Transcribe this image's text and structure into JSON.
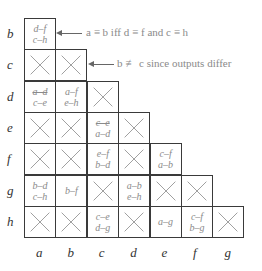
{
  "row_labels": [
    "b",
    "c",
    "d",
    "e",
    "f",
    "g",
    "h"
  ],
  "col_labels": [
    "a",
    "b",
    "c",
    "d",
    "e",
    "f",
    "g"
  ],
  "cells": [
    {
      "row": "b",
      "col": "a",
      "type": "pairs",
      "pairs": [
        "d–f",
        "c–h"
      ]
    },
    {
      "row": "c",
      "col": "a",
      "type": "x"
    },
    {
      "row": "c",
      "col": "b",
      "type": "x"
    },
    {
      "row": "d",
      "col": "a",
      "type": "pairs",
      "pairs": [
        "a–d",
        "c–e"
      ],
      "struck": [
        true,
        false
      ]
    },
    {
      "row": "d",
      "col": "b",
      "type": "pairs",
      "pairs": [
        "a–f",
        "e–h"
      ]
    },
    {
      "row": "d",
      "col": "c",
      "type": "x"
    },
    {
      "row": "e",
      "col": "a",
      "type": "x"
    },
    {
      "row": "e",
      "col": "b",
      "type": "x"
    },
    {
      "row": "e",
      "col": "c",
      "type": "pairs",
      "pairs": [
        "c–e",
        "a–d"
      ],
      "struck": [
        true,
        false
      ]
    },
    {
      "row": "e",
      "col": "d",
      "type": "x"
    },
    {
      "row": "f",
      "col": "a",
      "type": "x"
    },
    {
      "row": "f",
      "col": "b",
      "type": "x"
    },
    {
      "row": "f",
      "col": "c",
      "type": "pairs",
      "pairs": [
        "e–f",
        "b–d"
      ]
    },
    {
      "row": "f",
      "col": "d",
      "type": "x"
    },
    {
      "row": "f",
      "col": "e",
      "type": "pairs",
      "pairs": [
        "c–f",
        "a–b"
      ]
    },
    {
      "row": "g",
      "col": "a",
      "type": "pairs",
      "pairs": [
        "b–d",
        "c–h"
      ]
    },
    {
      "row": "g",
      "col": "b",
      "type": "pairs",
      "pairs": [
        "b–f"
      ]
    },
    {
      "row": "g",
      "col": "c",
      "type": "x"
    },
    {
      "row": "g",
      "col": "d",
      "type": "pairs",
      "pairs": [
        "a–b",
        "e–h"
      ]
    },
    {
      "row": "g",
      "col": "e",
      "type": "x"
    },
    {
      "row": "g",
      "col": "f",
      "type": "x"
    },
    {
      "row": "h",
      "col": "a",
      "type": "x"
    },
    {
      "row": "h",
      "col": "b",
      "type": "x"
    },
    {
      "row": "h",
      "col": "c",
      "type": "pairs",
      "pairs": [
        "c–e",
        "d–g"
      ]
    },
    {
      "row": "h",
      "col": "d",
      "type": "x"
    },
    {
      "row": "h",
      "col": "e",
      "type": "pairs",
      "pairs": [
        "a–g"
      ]
    },
    {
      "row": "h",
      "col": "f",
      "type": "pairs",
      "pairs": [
        "c–f",
        "b–g"
      ]
    },
    {
      "row": "h",
      "col": "g",
      "type": "x"
    }
  ],
  "annotations": [
    {
      "text": "a ≡ b iff d ≡ f and c ≡ h",
      "target": "b-a"
    },
    {
      "text": "b ≢ c since outputs differ",
      "target": "c-b"
    }
  ],
  "colors": {
    "grid": "#3a3a3a",
    "x_mark": "#9a9a9a",
    "pair_text": "#8a8a8a",
    "label": "#333333"
  }
}
